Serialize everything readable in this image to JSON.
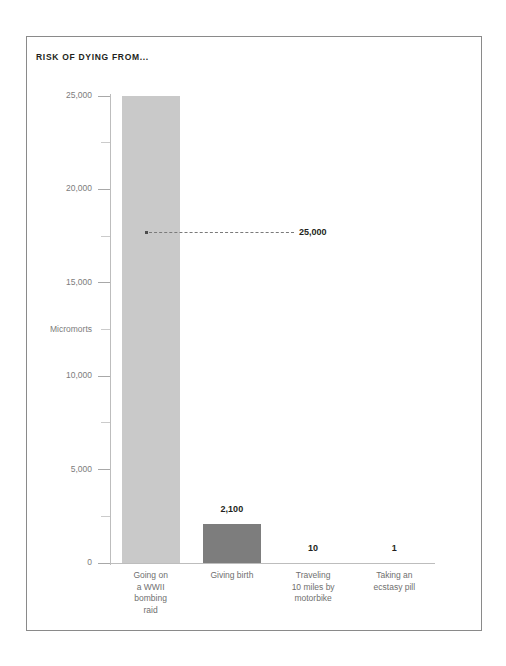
{
  "chart_title": "RISK OF DYING FROM...",
  "axis": {
    "y_label": "Micromorts",
    "y_ticks_major": [
      "0",
      "5,000",
      "10,000",
      "15,000",
      "20,000",
      "25,000"
    ],
    "y_tick_minor_values": [
      2500,
      7500,
      12500,
      17500,
      22500
    ]
  },
  "annotation": {
    "label": "25,000"
  },
  "colors": {
    "bar_light": "#c9c9c9",
    "bar_dark": "#7d7d7d",
    "frame": "#8a8a8a",
    "tick_text": "#7c7c7c",
    "category_text": "#6f6f6f",
    "value_text": "#231f20"
  },
  "chart_data": {
    "type": "bar",
    "title": "RISK OF DYING FROM...",
    "xlabel": "",
    "ylabel": "Micromorts",
    "ylim": [
      0,
      25000
    ],
    "yticks": [
      0,
      5000,
      10000,
      15000,
      20000,
      25000
    ],
    "ytick_labels": [
      "0",
      "5,000",
      "10,000",
      "15,000",
      "20,000",
      "25,000"
    ],
    "grid": false,
    "legend": null,
    "categories": [
      "Going on a WWII bombing raid",
      "Giving birth",
      "Traveling 10 miles by motorbike",
      "Taking an ecstasy pill"
    ],
    "values": [
      25000,
      2100,
      10,
      1
    ],
    "value_labels": [
      "25,000",
      "2,100",
      "10",
      "1"
    ],
    "bar_colors": [
      "#c9c9c9",
      "#7d7d7d",
      "#7d7d7d",
      "#7d7d7d"
    ],
    "annotations": [
      {
        "text": "25,000",
        "series_index": 0,
        "value": 25000,
        "style": "dotted-leader-line"
      }
    ]
  },
  "categories_display": [
    {
      "lines": [
        "Going on",
        "a WWII",
        "bombing",
        "raid"
      ]
    },
    {
      "lines": [
        "Giving birth"
      ]
    },
    {
      "lines": [
        "Traveling",
        "10 miles by",
        "motorbike"
      ]
    },
    {
      "lines": [
        "Taking an",
        "ecstasy pill"
      ]
    }
  ]
}
